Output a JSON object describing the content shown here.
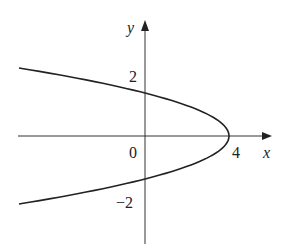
{
  "chart_data": {
    "type": "line",
    "title": "",
    "equation": "x = 4 - y^2",
    "xlabel": "x",
    "ylabel": "y",
    "x_ticks": [
      {
        "value": 0,
        "label": "0"
      },
      {
        "value": 4,
        "label": "4"
      }
    ],
    "y_ticks": [
      {
        "value": 2,
        "label": "2"
      },
      {
        "value": -2,
        "label": "−2"
      }
    ],
    "xlim": [
      -6,
      6
    ],
    "ylim": [
      -5,
      5.5
    ],
    "grid": false,
    "series": [
      {
        "name": "parabola",
        "points": [
          {
            "x": -6,
            "y": 3.16
          },
          {
            "x": -5,
            "y": 3
          },
          {
            "x": -3,
            "y": 2.65
          },
          {
            "x": 0,
            "y": 2
          },
          {
            "x": 3,
            "y": 1
          },
          {
            "x": 4,
            "y": 0
          },
          {
            "x": 3,
            "y": -1
          },
          {
            "x": 0,
            "y": -2
          },
          {
            "x": -3,
            "y": -2.65
          },
          {
            "x": -5,
            "y": -3
          },
          {
            "x": -6,
            "y": -3.16
          }
        ]
      }
    ]
  },
  "labels": {
    "x_axis": "x",
    "y_axis": "y",
    "origin": "0",
    "x_tick_4": "4",
    "y_tick_2": "2",
    "y_tick_neg2": "−2"
  }
}
